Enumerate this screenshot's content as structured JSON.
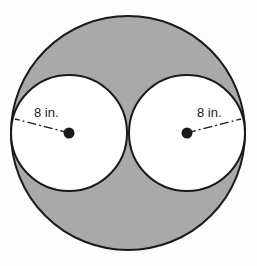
{
  "figure": {
    "background_color": "#fdfdfd",
    "shaded_region_color": "#a9a9a9",
    "inner_fill_color": "#ffffff",
    "stroke_color": "#1a1a1a",
    "label_color": "#1a1a1a"
  },
  "shapes": {
    "outer_circle": {
      "name": "outer-circle",
      "cx": 128,
      "cy": 133,
      "r": 117,
      "fill": "#a9a9a9",
      "stroke": "#1a1a1a",
      "stroke_width": 2
    },
    "left_circle": {
      "name": "left-inner-circle",
      "cx": 69,
      "cy": 133,
      "r": 58,
      "fill": "#ffffff",
      "stroke": "#1a1a1a",
      "stroke_width": 2
    },
    "right_circle": {
      "name": "right-inner-circle",
      "cx": 187,
      "cy": 133,
      "r": 58,
      "fill": "#ffffff",
      "stroke": "#1a1a1a",
      "stroke_width": 2
    }
  },
  "center_points": [
    {
      "name": "left-center-point",
      "cx": 69,
      "cy": 133,
      "r": 5.5
    },
    {
      "name": "right-center-point",
      "cx": 187,
      "cy": 133,
      "r": 5.5
    }
  ],
  "radius_lines": [
    {
      "name": "left-radius-line",
      "x1": 69,
      "y1": 133,
      "x2": 15,
      "y2": 119,
      "dash_pattern": "9,3,2,3",
      "stroke_width": 1.3
    },
    {
      "name": "right-radius-line",
      "x1": 187,
      "y1": 133,
      "x2": 241,
      "y2": 119,
      "dash_pattern": "9,3,2,3",
      "stroke_width": 1.3
    }
  ],
  "labels": {
    "left_radius": {
      "text": "8 in.",
      "x": 34,
      "y": 117,
      "anchor": "start"
    },
    "right_radius": {
      "text": "8 in.",
      "x": 197,
      "y": 117,
      "anchor": "start"
    }
  }
}
